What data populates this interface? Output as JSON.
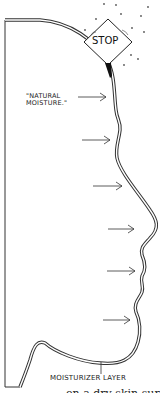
{
  "diagram": {
    "type": "illustration",
    "labels": {
      "natural_moisture": "\"NATURAL\nMOISTURE.\"",
      "moisturizer_layer": "MOISTURIZER LAYER",
      "stop_sign": "STOP",
      "cutoff_caption": "on a dry skin sur"
    },
    "arrows": [
      {
        "y": 97,
        "x_start": 78,
        "x_end": 106
      },
      {
        "y": 140,
        "x_start": 82,
        "x_end": 110
      },
      {
        "y": 186,
        "x_start": 93,
        "x_end": 122
      },
      {
        "y": 229,
        "x_start": 108,
        "x_end": 134
      },
      {
        "y": 271,
        "x_start": 107,
        "x_end": 135
      },
      {
        "y": 320,
        "x_start": 103,
        "x_end": 130
      }
    ],
    "colors": {
      "stroke": "#222222",
      "background": "#ffffff"
    }
  }
}
